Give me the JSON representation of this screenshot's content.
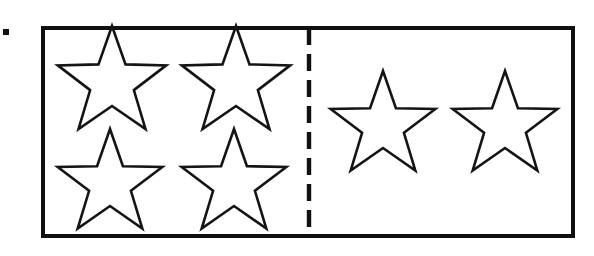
{
  "figure": {
    "kind": "partitioned-rectangle-star-diagram",
    "bullet_marker": {
      "shape": "square-dot",
      "color": "#111111",
      "x": 3,
      "y": 29,
      "size": 6
    },
    "border": {
      "x": 41,
      "y": 26,
      "width": 534,
      "height": 212,
      "stroke_color": "#111111",
      "stroke_width": 4
    },
    "divider": {
      "orientation": "vertical",
      "style": "dashed",
      "x": 309,
      "y_start": 28,
      "y_end": 236,
      "stroke_color": "#111111",
      "stroke_width": 4.4,
      "dash_length": 17,
      "gap_length": 9
    },
    "groups": [
      {
        "name": "left-group",
        "star_count": 4,
        "arrangement": "2x2-grid",
        "stars": [
          {
            "label": "left-star-top-left",
            "cx": 112,
            "cy": 83,
            "outer_radius": 57,
            "inner_radius": 23,
            "rotation": 0
          },
          {
            "label": "left-star-top-right",
            "cx": 236,
            "cy": 83,
            "outer_radius": 57,
            "inner_radius": 23,
            "rotation": 0
          },
          {
            "label": "left-star-bottom-left",
            "cx": 110,
            "cy": 184,
            "outer_radius": 55,
            "inner_radius": 22,
            "rotation": 0
          },
          {
            "label": "left-star-bottom-right",
            "cx": 234,
            "cy": 184,
            "outer_radius": 55,
            "inner_radius": 22,
            "rotation": 0
          }
        ]
      },
      {
        "name": "right-group",
        "star_count": 2,
        "arrangement": "1x2-row",
        "stars": [
          {
            "label": "right-star-left",
            "cx": 383,
            "cy": 126,
            "outer_radius": 55,
            "inner_radius": 22,
            "rotation": 0
          },
          {
            "label": "right-star-right",
            "cx": 505,
            "cy": 126,
            "outer_radius": 55,
            "inner_radius": 22,
            "rotation": 0
          }
        ]
      }
    ],
    "totals": {
      "stars_total": 6,
      "left_count": 4,
      "right_count": 2
    },
    "colors": {
      "background": "#ffffff",
      "ink": "#111111",
      "star_stroke": "#141414",
      "star_fill": "#ffffff"
    }
  },
  "caption": {
    "alt_text": "A rectangle split by a dashed vertical line: four stars on the left side and two stars on the right side, six stars in all."
  }
}
